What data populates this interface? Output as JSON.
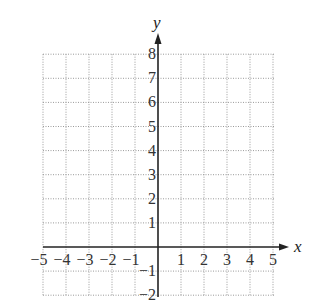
{
  "chart_data": {
    "type": "scatter",
    "title": "",
    "xlabel": "x",
    "ylabel": "y",
    "xlim": [
      -5,
      5
    ],
    "ylim": [
      -2,
      8
    ],
    "grid": true,
    "grid_style": "dotted",
    "x_ticks": [
      -5,
      -4,
      -3,
      -2,
      -1,
      1,
      2,
      3,
      4,
      5
    ],
    "y_ticks": [
      -2,
      -1,
      1,
      2,
      3,
      4,
      5,
      6,
      7,
      8
    ],
    "x_tick_labels": [
      "−5",
      "−4",
      "−3",
      "−2",
      "−1",
      "1",
      "2",
      "3",
      "4",
      "5"
    ],
    "y_tick_labels": [
      "−2",
      "−1",
      "1",
      "2",
      "3",
      "4",
      "5",
      "6",
      "7",
      "8"
    ],
    "series": [],
    "legend": null
  },
  "colors": {
    "axis": "#222222",
    "grid": "#9a9a9a",
    "text": "#333333"
  }
}
